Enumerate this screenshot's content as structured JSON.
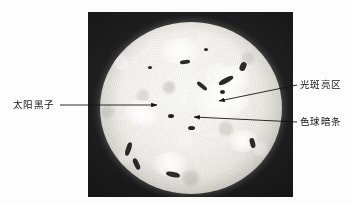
{
  "figure": {
    "type": "annotated-photograph",
    "background_color": "#ffffff",
    "photo": {
      "name": "sun-photo",
      "frame_color": "#171717",
      "disk_color": "#f6f5f1",
      "position": {
        "x": 88,
        "y": 12,
        "width": 205,
        "height": 185
      }
    },
    "annotations": [
      {
        "id": "sunspot",
        "label": "太阳黑子",
        "side": "left",
        "label_position": {
          "x": 13,
          "y": 100
        },
        "leader": {
          "x1": 60,
          "y1": 105,
          "x2": 157,
          "y2": 105
        },
        "arrow_tip": {
          "x": 157,
          "y": 105
        }
      },
      {
        "id": "facula-bright-region",
        "label": "光斑亮区",
        "side": "right",
        "label_position": {
          "x": 300,
          "y": 80
        },
        "leader": {
          "x1": 297,
          "y1": 85,
          "x2": 218,
          "y2": 101
        },
        "arrow_tip": {
          "x": 218,
          "y": 101
        }
      },
      {
        "id": "chromosphere-dark-filament",
        "label": "色球暗条",
        "side": "right",
        "label_position": {
          "x": 300,
          "y": 117
        },
        "leader": {
          "x1": 297,
          "y1": 122,
          "x2": 193,
          "y2": 117
        },
        "arrow_tip": {
          "x": 193,
          "y": 117
        }
      }
    ],
    "line_color": "#1a1a1a",
    "text_color": "#141414"
  }
}
